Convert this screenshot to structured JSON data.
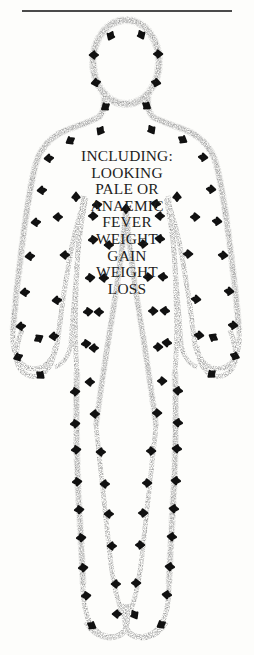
{
  "page": {
    "background_color": "#fdfdfb",
    "width": 254,
    "height": 655
  },
  "top_rule": {
    "name": "horizontal-rule",
    "color": "#4b4b4b"
  },
  "figure": {
    "outline_style": "stippled-dotted",
    "outline_color": "#b9b9b9",
    "arrow_color": "#111111"
  },
  "symptoms": {
    "heading": "INCLUDING:",
    "lines": [
      "INCLUDING:",
      "LOOKING",
      "PALE OR",
      "ANAEMIC",
      "FEVER",
      "WEIGHT",
      "GAIN",
      "WEIGHT",
      "LOSS"
    ],
    "text_color": "#1d1d1d"
  }
}
